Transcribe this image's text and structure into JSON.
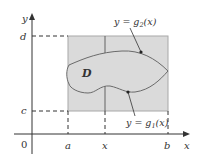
{
  "figure": {
    "colors": {
      "background": "#ffffff",
      "rect_fill": "#dadada",
      "rect_stroke": "#a8a8a8",
      "curve": "#6a6a6a",
      "axis": "#333333",
      "dashed": "#333333"
    },
    "axes": {
      "x_label": "x",
      "y_label": "y",
      "origin_label": "0"
    },
    "x_ticks": [
      {
        "label": "a"
      },
      {
        "label": "x"
      },
      {
        "label": "b"
      }
    ],
    "y_ticks": [
      {
        "label": "d"
      },
      {
        "label": "c"
      }
    ],
    "region_label": "D",
    "curve_labels": {
      "upper": {
        "prefix": "y = g",
        "sub": "2",
        "suffix": "(x)"
      },
      "lower": {
        "prefix": "y = g",
        "sub": "1",
        "suffix": "(x)"
      }
    }
  }
}
